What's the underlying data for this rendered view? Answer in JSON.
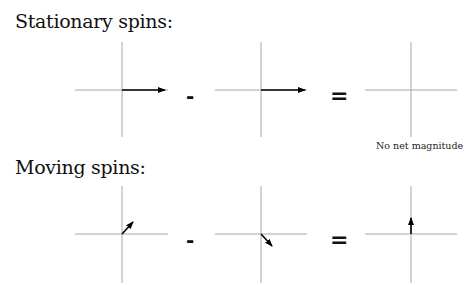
{
  "sections": [
    {
      "title": "Stationary spins:",
      "operators": [
        "-",
        "="
      ],
      "caption": "No net magnitude",
      "vectors": [
        {
          "name": "spin-1",
          "direction": "right",
          "dx": 43,
          "dy": 0
        },
        {
          "name": "spin-2",
          "direction": "right",
          "dx": 44,
          "dy": 0
        },
        {
          "name": "result",
          "direction": "none",
          "dx": 0,
          "dy": 0
        }
      ]
    },
    {
      "title": "Moving spins:",
      "operators": [
        "-",
        "="
      ],
      "vectors": [
        {
          "name": "spin-1",
          "direction": "up-right",
          "dx": 11,
          "dy": -12
        },
        {
          "name": "spin-2",
          "direction": "down-right",
          "dx": 11,
          "dy": 12
        },
        {
          "name": "result",
          "direction": "up",
          "dx": 0,
          "dy": -16
        }
      ]
    }
  ],
  "colors": {
    "axis": "#a8a8a8",
    "arrow": "#000000",
    "text": "#111111"
  }
}
